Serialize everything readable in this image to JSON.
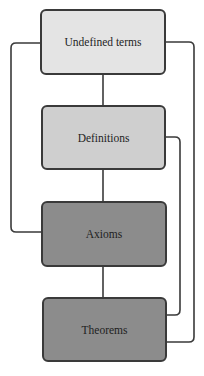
{
  "diagram": {
    "title": "",
    "nodes": [
      {
        "id": "undefined-terms",
        "label": "Undefined terms",
        "fill": "#e4e4e4"
      },
      {
        "id": "definitions",
        "label": "Definitions",
        "fill": "#cfcfcf"
      },
      {
        "id": "axioms",
        "label": "Axioms",
        "fill": "#8c8c8c"
      },
      {
        "id": "theorems",
        "label": "Theorems",
        "fill": "#8c8c8c"
      }
    ],
    "edges": [
      {
        "from": "Undefined terms",
        "to": "Definitions"
      },
      {
        "from": "Undefined terms",
        "to": "Axioms"
      },
      {
        "from": "Undefined terms",
        "to": "Theorems"
      },
      {
        "from": "Definitions",
        "to": "Axioms"
      },
      {
        "from": "Definitions",
        "to": "Theorems"
      },
      {
        "from": "Axioms",
        "to": "Theorems"
      }
    ],
    "line_color": "#3a3a3a"
  }
}
